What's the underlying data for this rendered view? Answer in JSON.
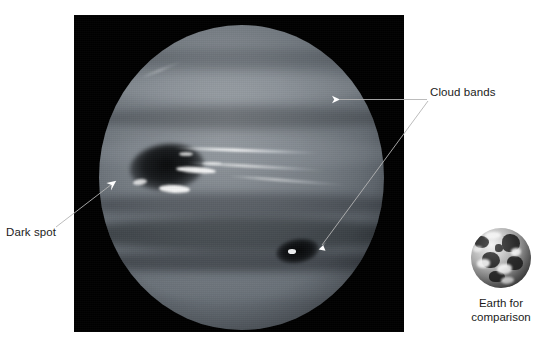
{
  "figure": {
    "background_color": "#ffffff"
  },
  "photo": {
    "name": "neptune-photograph",
    "background_color": "#000000",
    "planet_name": "Neptune",
    "features": {
      "great_dark_spot": "Great Dark Spot",
      "second_dark_spot": "Dark Spot 2",
      "cirrus_clouds": "bright cirrus clouds",
      "cloud_bands": "latitudinal cloud bands"
    }
  },
  "annotations": [
    {
      "id": "cloud-bands",
      "label": "Cloud bands",
      "color": "#ffffff",
      "arrows": 2
    },
    {
      "id": "dark-spot",
      "label": "Dark spot",
      "color": "#ffffff",
      "arrows": 1
    }
  ],
  "labels": {
    "cloud_bands": "Cloud bands",
    "dark_spot": "Dark spot"
  },
  "earth_inset": {
    "name": "earth-globe",
    "caption_line1": "Earth for",
    "caption_line2": "comparison"
  }
}
